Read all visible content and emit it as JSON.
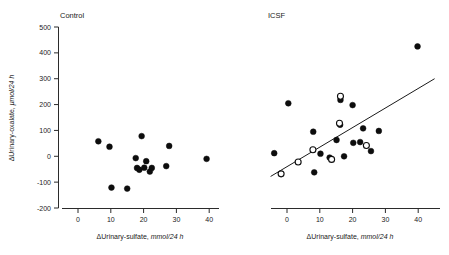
{
  "figure": {
    "axis_labels": {
      "x_delta": "ΔUrinary-sulfate, ",
      "x_units": "mmol/24 h",
      "x_full": "ΔUrinary-sulfate, mmol/24 h",
      "y_delta": "ΔUrinary-oxalate, ",
      "y_units": "μmol/24 h",
      "y_full": "ΔUrinary-oxalate, μmol/24 h"
    },
    "colors": {
      "axis": "#2b2b2b",
      "marker_filled": "#0d0d0d",
      "marker_open_fill": "#ffffff",
      "marker_open_stroke": "#0d0d0d",
      "fit_line": "#1a1a1a",
      "background": "#ffffff"
    }
  },
  "chart_data": [
    {
      "type": "scatter",
      "title": "Control",
      "panel": "left",
      "xlabel": "ΔUrinary-sulfate, mmol/24 h",
      "ylabel": "ΔUrinary-oxalate, μmol/24 h",
      "xlim": [
        -6,
        45
      ],
      "ylim": [
        -200,
        500
      ],
      "xticks": [
        0,
        10,
        20,
        30,
        40
      ],
      "yticks": [
        -200,
        -100,
        0,
        100,
        200,
        300,
        400,
        500
      ],
      "xticklabels": [
        "0",
        "10",
        "20",
        "30",
        "40"
      ],
      "yticklabels": [
        "-200",
        "-100",
        "0",
        "100",
        "200",
        "300",
        "400",
        "500"
      ],
      "grid": false,
      "legend": null,
      "has_fit_line": false,
      "series": [
        {
          "name": "Control subjects",
          "marker": "filled-circle",
          "points": [
            [
              6.2,
              58
            ],
            [
              9.6,
              37
            ],
            [
              19.4,
              78
            ],
            [
              27.8,
              40
            ],
            [
              17.6,
              -7
            ],
            [
              20.8,
              -19
            ],
            [
              18.0,
              -45
            ],
            [
              18.7,
              -52
            ],
            [
              21.9,
              -59
            ],
            [
              26.9,
              -38
            ],
            [
              39.2,
              -10
            ],
            [
              10.2,
              -121
            ],
            [
              15.0,
              -125
            ],
            [
              22.5,
              -45
            ],
            [
              20.2,
              -44
            ]
          ]
        }
      ]
    },
    {
      "type": "scatter",
      "title": "ICSF",
      "panel": "right",
      "xlabel": "ΔUrinary-sulfate, mmol/24 h",
      "ylabel": "ΔUrinary-oxalate, μmol/24 h",
      "xlim": [
        -6,
        45
      ],
      "ylim": [
        -200,
        500
      ],
      "xticks": [
        0,
        10,
        20,
        30,
        40
      ],
      "yticks": [
        -200,
        -100,
        0,
        100,
        200,
        300,
        400,
        500
      ],
      "xticklabels": [
        "0",
        "10",
        "20",
        "30",
        "40"
      ],
      "yticklabels": [
        "-200",
        "-100",
        "0",
        "100",
        "200",
        "300",
        "400",
        "500"
      ],
      "grid": false,
      "legend": null,
      "has_fit_line": true,
      "fit_line": {
        "x_start": -5.0,
        "y_start": -78,
        "x_end": 45.0,
        "y_end": 300
      },
      "series": [
        {
          "name": "ICSF patients",
          "marker": "filled-circle",
          "points": [
            [
              39.8,
              425
            ],
            [
              16.3,
              218
            ],
            [
              20.0,
              198
            ],
            [
              0.4,
              205
            ],
            [
              16.2,
              122
            ],
            [
              8.0,
              95
            ],
            [
              23.2,
              108
            ],
            [
              28.0,
              98
            ],
            [
              15.1,
              63
            ],
            [
              20.2,
              52
            ],
            [
              10.2,
              10
            ],
            [
              -3.9,
              12
            ],
            [
              13.0,
              -5
            ],
            [
              8.3,
              -62
            ],
            [
              17.4,
              0
            ],
            [
              22.3,
              55
            ],
            [
              25.6,
              20
            ]
          ]
        },
        {
          "name": "ICSF patients (open)",
          "marker": "open-circle",
          "points": [
            [
              16.3,
              232
            ],
            [
              16.0,
              128
            ],
            [
              7.9,
              25
            ],
            [
              13.6,
              -12
            ],
            [
              3.4,
              -22
            ],
            [
              24.2,
              42
            ],
            [
              -1.8,
              -68
            ]
          ]
        }
      ]
    }
  ]
}
